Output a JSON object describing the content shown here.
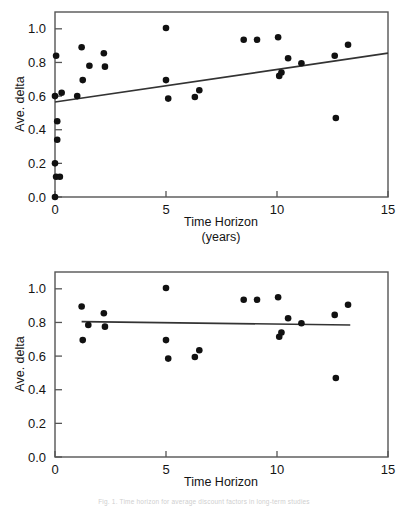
{
  "figure": {
    "caption_partial": "Fig. 1.  Time horizon for average discount factors in long-term studies",
    "point_color": "#111111",
    "line_color": "#333333",
    "frame_color": "#555555"
  },
  "chart_data": [
    {
      "type": "scatter",
      "panel": "top",
      "title": "",
      "xlabel": "Time Horizon",
      "xlabel_line2": "(years)",
      "ylabel": "Ave. delta",
      "xlim": [
        0,
        15
      ],
      "ylim": [
        0,
        1.1
      ],
      "xticks": [
        0,
        5,
        10,
        15
      ],
      "xtick_labels": [
        "0",
        "5",
        "10",
        "15"
      ],
      "yticks": [
        0.0,
        0.2,
        0.4,
        0.6,
        0.8,
        1.0
      ],
      "ytick_labels": [
        "0.0",
        "0.2",
        "0.4",
        "0.6",
        "0.8",
        "1.0"
      ],
      "grid": false,
      "legend": "none",
      "points": [
        {
          "x": 0.0,
          "y": 0.0
        },
        {
          "x": 0.05,
          "y": 0.12
        },
        {
          "x": 0.22,
          "y": 0.12
        },
        {
          "x": 0.0,
          "y": 0.2
        },
        {
          "x": 0.1,
          "y": 0.34
        },
        {
          "x": 0.1,
          "y": 0.45
        },
        {
          "x": 0.0,
          "y": 0.6
        },
        {
          "x": 0.3,
          "y": 0.62
        },
        {
          "x": 1.0,
          "y": 0.6
        },
        {
          "x": 0.05,
          "y": 0.84
        },
        {
          "x": 1.2,
          "y": 0.89
        },
        {
          "x": 1.25,
          "y": 0.695
        },
        {
          "x": 1.55,
          "y": 0.78
        },
        {
          "x": 2.2,
          "y": 0.855
        },
        {
          "x": 2.25,
          "y": 0.775
        },
        {
          "x": 5.0,
          "y": 1.005
        },
        {
          "x": 5.0,
          "y": 0.695
        },
        {
          "x": 5.1,
          "y": 0.585
        },
        {
          "x": 6.3,
          "y": 0.595
        },
        {
          "x": 6.5,
          "y": 0.635
        },
        {
          "x": 8.5,
          "y": 0.935
        },
        {
          "x": 9.1,
          "y": 0.935
        },
        {
          "x": 10.05,
          "y": 0.95
        },
        {
          "x": 10.1,
          "y": 0.72
        },
        {
          "x": 10.2,
          "y": 0.74
        },
        {
          "x": 10.5,
          "y": 0.825
        },
        {
          "x": 11.1,
          "y": 0.795
        },
        {
          "x": 12.6,
          "y": 0.84
        },
        {
          "x": 12.65,
          "y": 0.47
        },
        {
          "x": 13.2,
          "y": 0.905
        }
      ],
      "fit_line": {
        "x0": 0.0,
        "y0": 0.565,
        "x1": 15.0,
        "y1": 0.855,
        "label": "linear fit"
      }
    },
    {
      "type": "scatter",
      "panel": "bottom",
      "title": "",
      "xlabel": "Time Horizon",
      "xlabel_line2": "(years)",
      "ylabel": "Ave. delta",
      "xlim": [
        0,
        15
      ],
      "ylim": [
        0,
        1.1
      ],
      "xticks": [
        0,
        5,
        10,
        15
      ],
      "xtick_labels": [
        "0",
        "5",
        "10",
        "15"
      ],
      "yticks": [
        0.0,
        0.2,
        0.4,
        0.6,
        0.8,
        1.0
      ],
      "ytick_labels": [
        "0.0",
        "0.2",
        "0.4",
        "0.6",
        "0.8",
        "1.0"
      ],
      "grid": false,
      "legend": "none",
      "points": [
        {
          "x": 1.2,
          "y": 0.895
        },
        {
          "x": 1.25,
          "y": 0.695
        },
        {
          "x": 1.5,
          "y": 0.785
        },
        {
          "x": 2.2,
          "y": 0.855
        },
        {
          "x": 2.25,
          "y": 0.775
        },
        {
          "x": 5.0,
          "y": 1.005
        },
        {
          "x": 5.0,
          "y": 0.695
        },
        {
          "x": 5.1,
          "y": 0.585
        },
        {
          "x": 6.3,
          "y": 0.595
        },
        {
          "x": 6.5,
          "y": 0.635
        },
        {
          "x": 8.5,
          "y": 0.935
        },
        {
          "x": 9.1,
          "y": 0.935
        },
        {
          "x": 10.05,
          "y": 0.95
        },
        {
          "x": 10.1,
          "y": 0.715
        },
        {
          "x": 10.2,
          "y": 0.74
        },
        {
          "x": 10.5,
          "y": 0.825
        },
        {
          "x": 11.1,
          "y": 0.795
        },
        {
          "x": 12.6,
          "y": 0.845
        },
        {
          "x": 12.65,
          "y": 0.47
        },
        {
          "x": 13.2,
          "y": 0.905
        }
      ],
      "fit_line": {
        "x0": 1.2,
        "y0": 0.805,
        "x1": 13.3,
        "y1": 0.785,
        "label": "linear fit"
      }
    }
  ]
}
